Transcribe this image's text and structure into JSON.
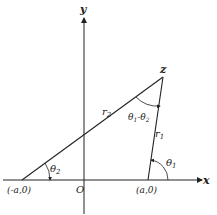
{
  "diagram": {
    "axes": {
      "x_label": "x",
      "y_label": "y",
      "origin_label": "O"
    },
    "points": {
      "apex": "z",
      "left": "(-a,0)",
      "right": "(a,0)"
    },
    "segments": {
      "r1": "r",
      "r1_sub": "1",
      "r2": "r",
      "r2_sub": "2"
    },
    "angles": {
      "theta1": "θ",
      "theta1_sub": "1",
      "theta2": "θ",
      "theta2_sub": "2",
      "diff_a": "θ",
      "diff_a_sub": "1",
      "diff_minus": "-",
      "diff_b": "θ",
      "diff_b_sub": "2"
    },
    "colors": {
      "ink": "#222222",
      "background": "#ffffff"
    }
  }
}
